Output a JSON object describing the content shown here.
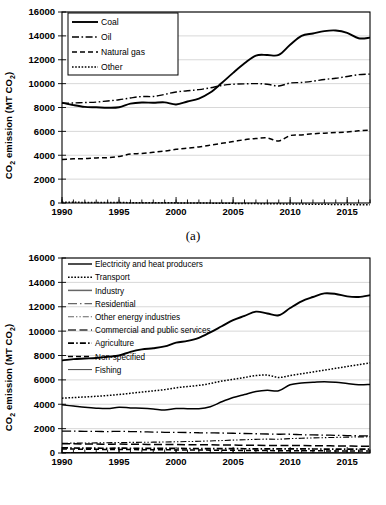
{
  "figure": {
    "panels": [
      {
        "id": "a",
        "caption": "(a)"
      },
      {
        "id": "b",
        "caption": "(b)"
      }
    ]
  },
  "chart_data": [
    {
      "type": "line",
      "panel": "(a)",
      "title": "",
      "xlabel": "",
      "ylabel": "CO2 emission (MT CO2)",
      "ylabel_rich": "CO₂ emission (MT CO₂)",
      "xlim": [
        1990,
        2017
      ],
      "ylim": [
        0,
        16000
      ],
      "yticks": [
        0,
        2000,
        4000,
        6000,
        8000,
        10000,
        12000,
        14000,
        16000
      ],
      "xticks": [
        1990,
        1995,
        2000,
        2005,
        2010,
        2015
      ],
      "xtick_minor_step": 1,
      "grid": "horizontal",
      "legend_position": "top-left-inside",
      "x": [
        1990,
        1991,
        1992,
        1993,
        1994,
        1995,
        1996,
        1997,
        1998,
        1999,
        2000,
        2001,
        2002,
        2003,
        2004,
        2005,
        2006,
        2007,
        2008,
        2009,
        2010,
        2011,
        2012,
        2013,
        2014,
        2015,
        2016,
        2017
      ],
      "series": [
        {
          "name": "Coal",
          "style": "solid",
          "color": "#000000",
          "values": [
            8400,
            8200,
            8050,
            8020,
            7980,
            8020,
            8320,
            8420,
            8400,
            8430,
            8250,
            8500,
            8750,
            9250,
            10050,
            10900,
            11700,
            12350,
            12400,
            12400,
            13250,
            14000,
            14200,
            14400,
            14450,
            14250,
            13800,
            13850
          ]
        },
        {
          "name": "Oil",
          "style": "dash-dot",
          "color": "#000000",
          "values": [
            8350,
            8380,
            8420,
            8450,
            8550,
            8650,
            8800,
            8920,
            8920,
            9100,
            9300,
            9400,
            9500,
            9650,
            9850,
            9950,
            9980,
            10000,
            9950,
            9800,
            10050,
            10100,
            10200,
            10350,
            10450,
            10600,
            10750,
            10800
          ]
        },
        {
          "name": "Natural gas",
          "style": "dashed",
          "color": "#000000",
          "values": [
            3650,
            3700,
            3720,
            3780,
            3800,
            3900,
            4100,
            4150,
            4250,
            4350,
            4500,
            4600,
            4700,
            4850,
            5000,
            5150,
            5300,
            5400,
            5450,
            5200,
            5650,
            5700,
            5800,
            5850,
            5900,
            5950,
            6050,
            6100
          ]
        },
        {
          "name": "Other",
          "style": "dotted",
          "color": "#000000",
          "values": [
            60,
            55,
            50,
            45,
            40,
            35,
            30,
            25,
            20,
            15,
            10,
            5,
            0,
            -10,
            -20,
            -30,
            -40,
            -50,
            -60,
            -70,
            -80,
            -90,
            -100,
            -110,
            -120,
            -130,
            -140,
            -150
          ]
        }
      ]
    },
    {
      "type": "line",
      "panel": "(b)",
      "title": "",
      "xlabel": "",
      "ylabel": "CO2 emission (MT CO2)",
      "ylabel_rich": "CO₂ emission (MT CO₂)",
      "xlim": [
        1990,
        2017
      ],
      "ylim": [
        0,
        16000
      ],
      "yticks": [
        0,
        2000,
        4000,
        6000,
        8000,
        10000,
        12000,
        14000,
        16000
      ],
      "xticks": [
        1990,
        1995,
        2000,
        2005,
        2010,
        2015
      ],
      "xtick_minor_step": 1,
      "grid": "horizontal",
      "legend_position": "top-left-inside",
      "x": [
        1990,
        1991,
        1992,
        1993,
        1994,
        1995,
        1996,
        1997,
        1998,
        1999,
        2000,
        2001,
        2002,
        2003,
        2004,
        2005,
        2006,
        2007,
        2008,
        2009,
        2010,
        2011,
        2012,
        2013,
        2014,
        2015,
        2016,
        2017
      ],
      "series": [
        {
          "name": "Electricity and heat producers",
          "style": "solid",
          "color": "#444444",
          "values": [
            7600,
            7700,
            7750,
            7800,
            7900,
            8000,
            8300,
            8500,
            8600,
            8750,
            9050,
            9200,
            9450,
            9900,
            10400,
            10900,
            11250,
            11600,
            11450,
            11300,
            11900,
            12450,
            12800,
            13100,
            13050,
            12850,
            12800,
            12950
          ]
        },
        {
          "name": "Transport",
          "style": "dotted",
          "color": "#000000",
          "values": [
            4500,
            4550,
            4600,
            4650,
            4720,
            4800,
            4900,
            5000,
            5100,
            5200,
            5350,
            5450,
            5550,
            5700,
            5900,
            6050,
            6200,
            6350,
            6400,
            6200,
            6350,
            6500,
            6650,
            6800,
            6950,
            7100,
            7250,
            7400
          ]
        },
        {
          "name": "Industry",
          "style": "solid-gray",
          "color": "#666666",
          "values": [
            3950,
            3850,
            3750,
            3680,
            3650,
            3750,
            3700,
            3680,
            3620,
            3520,
            3650,
            3640,
            3630,
            3800,
            4200,
            4550,
            4800,
            5050,
            5150,
            5100,
            5600,
            5750,
            5800,
            5850,
            5800,
            5700,
            5600,
            5620
          ]
        },
        {
          "name": "Residential",
          "style": "long-dash-dot",
          "color": "#666666",
          "values": [
            1800,
            1790,
            1780,
            1770,
            1760,
            1780,
            1760,
            1740,
            1720,
            1700,
            1690,
            1680,
            1660,
            1650,
            1640,
            1620,
            1600,
            1580,
            1560,
            1540,
            1540,
            1500,
            1480,
            1470,
            1450,
            1430,
            1410,
            1400
          ]
        },
        {
          "name": "Other energy industries",
          "style": "dash-dot-dot",
          "color": "#666666",
          "values": [
            800,
            810,
            820,
            830,
            840,
            860,
            870,
            880,
            890,
            900,
            920,
            940,
            960,
            990,
            1020,
            1060,
            1090,
            1120,
            1140,
            1130,
            1180,
            1210,
            1240,
            1260,
            1280,
            1300,
            1320,
            1330
          ]
        },
        {
          "name": "Commercial and public services",
          "style": "long-dash",
          "color": "#333333",
          "values": [
            760,
            750,
            740,
            730,
            720,
            730,
            720,
            710,
            700,
            690,
            690,
            680,
            670,
            670,
            660,
            650,
            640,
            630,
            620,
            610,
            620,
            610,
            600,
            590,
            580,
            570,
            560,
            560
          ]
        },
        {
          "name": "Agriculture",
          "style": "dash-dot-thick",
          "color": "#000000",
          "values": [
            420,
            410,
            400,
            395,
            390,
            395,
            390,
            385,
            380,
            375,
            375,
            370,
            365,
            365,
            360,
            355,
            350,
            345,
            340,
            335,
            340,
            335,
            330,
            325,
            320,
            315,
            310,
            310
          ]
        },
        {
          "name": "Non-specified",
          "style": "dashed",
          "color": "#000000",
          "values": [
            330,
            320,
            310,
            300,
            290,
            290,
            280,
            275,
            270,
            260,
            255,
            250,
            240,
            235,
            230,
            220,
            210,
            205,
            200,
            190,
            190,
            185,
            180,
            175,
            170,
            165,
            160,
            155
          ]
        },
        {
          "name": "Fishing",
          "style": "solid-thin",
          "color": "#444444",
          "values": [
            40,
            38,
            36,
            35,
            34,
            34,
            33,
            32,
            31,
            30,
            30,
            29,
            28,
            28,
            27,
            26,
            25,
            25,
            24,
            23,
            23,
            22,
            21,
            21,
            20,
            20,
            19,
            19
          ]
        }
      ]
    }
  ]
}
